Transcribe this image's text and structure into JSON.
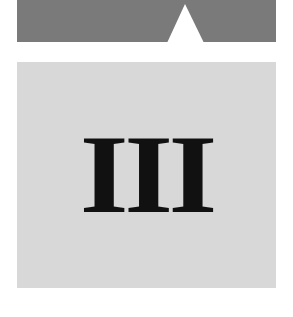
{
  "header": {
    "bar_color": "#7a7a7a",
    "notch_icon": "triangle-up-icon"
  },
  "panel": {
    "background": "#d8d8d8",
    "numeral": "III"
  }
}
